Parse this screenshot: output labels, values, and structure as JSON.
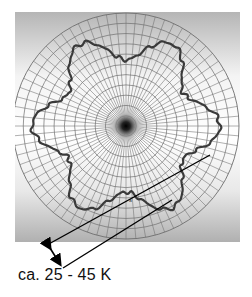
{
  "figure": {
    "type": "polar-grid-diagram",
    "background_gradient": [
      "#b9b9b9",
      "#ffffff",
      "#b3b3b3"
    ],
    "grid_color": "#6e6e6e",
    "curve_color": "#3a3a3a",
    "lobes": 6,
    "center_marker": "dark-radial-dot",
    "small_label": "a",
    "annotation": {
      "label": "ca. 25 - 45 K",
      "arrow": "double-headed",
      "lines": 2
    }
  }
}
